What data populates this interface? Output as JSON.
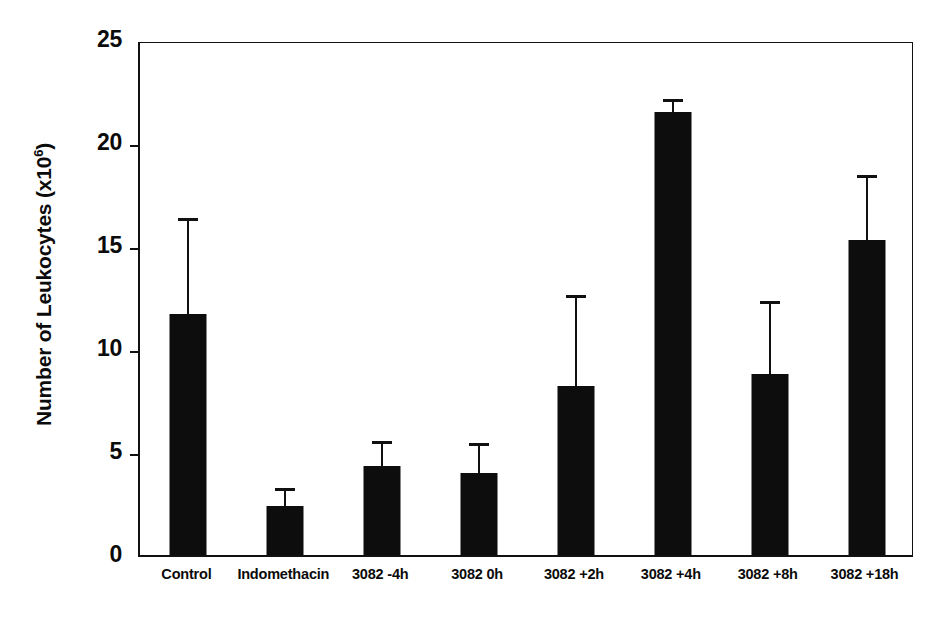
{
  "chart_data": {
    "type": "bar",
    "title": "",
    "xlabel": "",
    "ylabel": "Number of Leukocytes (x10^6)",
    "ylabel_base": "Number of Leukocytes (x10",
    "ylabel_sup": "6",
    "ylabel_tail": ")",
    "ylim": [
      0,
      25
    ],
    "yticks": [
      0,
      5,
      10,
      15,
      20,
      25
    ],
    "ytick_labels": [
      "0",
      "5",
      "10",
      "15",
      "20",
      "25"
    ],
    "grid": false,
    "legend": false,
    "bar_color": "#0d0d0d",
    "axis_color": "#111111",
    "categories": [
      "Control",
      "Indomethacin",
      "3082 -4h",
      "3082 0h",
      "3082 +2h",
      "3082 +4h",
      "3082 +8h",
      "3082 +18h"
    ],
    "values": [
      11.7,
      2.4,
      4.3,
      4.0,
      8.2,
      21.5,
      8.8,
      15.3
    ],
    "errors": [
      4.5,
      0.7,
      1.1,
      1.3,
      4.3,
      0.5,
      3.4,
      3.0
    ],
    "series": [
      {
        "name": "Number of Leukocytes",
        "values": [
          11.7,
          2.4,
          4.3,
          4.0,
          8.2,
          21.5,
          8.8,
          15.3
        ],
        "errors": [
          4.5,
          0.7,
          1.1,
          1.3,
          4.3,
          0.5,
          3.4,
          3.0
        ]
      }
    ]
  }
}
